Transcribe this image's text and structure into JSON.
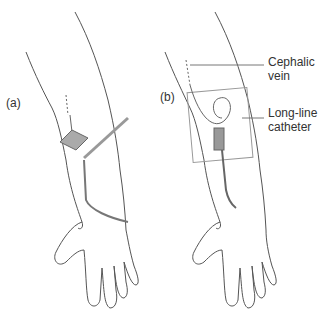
{
  "panels": [
    {
      "label": "(a)"
    },
    {
      "label": "(b)"
    }
  ],
  "annotations": {
    "vein_line1": "Cephalic",
    "vein_line2": "vein",
    "catheter_line1": "Long-line",
    "catheter_line2": "catheter"
  },
  "colors": {
    "outline": "#555555",
    "device": "#888888",
    "background": "#ffffff"
  }
}
